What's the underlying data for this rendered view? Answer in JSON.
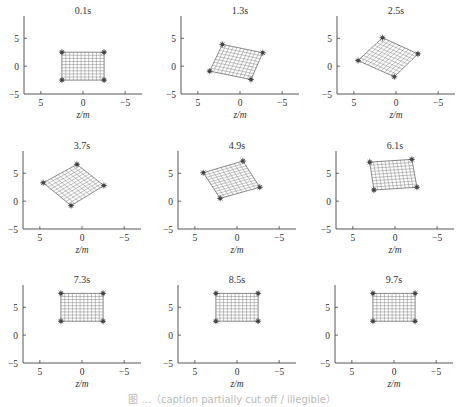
{
  "figure": {
    "caption": "图 ...（caption partially cut off / illegible）"
  },
  "chart_data": [
    {
      "type": "scatter",
      "title": "0.1s",
      "xlabel": "z/m",
      "ylabel": "",
      "xlim": [
        7,
        -7
      ],
      "ylim": [
        -5,
        9
      ],
      "xticks": [
        "5",
        "0",
        "−5"
      ],
      "yticks": [
        "5",
        "0",
        "−5"
      ],
      "corners": {
        "tl": [
          2.5,
          2.5
        ],
        "tr": [
          -2.5,
          2.5
        ],
        "br": [
          -2.5,
          -2.5
        ],
        "bl": [
          2.5,
          -2.5
        ]
      }
    },
    {
      "type": "scatter",
      "title": "1.3s",
      "xlabel": "z/m",
      "ylabel": "",
      "xlim": [
        7,
        -7
      ],
      "ylim": [
        -5,
        9
      ],
      "xticks": [
        "5",
        "0",
        "−5"
      ],
      "yticks": [
        "5",
        "0",
        "−5"
      ],
      "corners": {
        "tl": [
          2.1,
          3.9
        ],
        "tr": [
          -2.7,
          2.4
        ],
        "br": [
          -1.3,
          -2.4
        ],
        "bl": [
          3.6,
          -0.9
        ]
      }
    },
    {
      "type": "scatter",
      "title": "2.5s",
      "xlabel": "z/m",
      "ylabel": "",
      "xlim": [
        7,
        -7
      ],
      "ylim": [
        -5,
        9
      ],
      "xticks": [
        "5",
        "0",
        "−5"
      ],
      "yticks": [
        "5",
        "0",
        "−5"
      ],
      "corners": {
        "tl": [
          1.6,
          5.1
        ],
        "tr": [
          -2.6,
          2.2
        ],
        "br": [
          0.2,
          -1.9
        ],
        "bl": [
          4.5,
          1.0
        ]
      }
    },
    {
      "type": "scatter",
      "title": "3.7s",
      "xlabel": "z/m",
      "ylabel": "",
      "xlim": [
        7,
        -7
      ],
      "ylim": [
        -5,
        9
      ],
      "xticks": [
        "5",
        "0",
        "−5"
      ],
      "yticks": [
        "5",
        "0",
        "−5"
      ],
      "corners": {
        "tl": [
          0.6,
          6.6
        ],
        "tr": [
          -2.6,
          2.8
        ],
        "br": [
          1.3,
          -0.8
        ],
        "bl": [
          4.6,
          3.3
        ]
      }
    },
    {
      "type": "scatter",
      "title": "4.9s",
      "xlabel": "z/m",
      "ylabel": "",
      "xlim": [
        7,
        -7
      ],
      "ylim": [
        -5,
        9
      ],
      "xticks": [
        "5",
        "0",
        "−5"
      ],
      "yticks": [
        "5",
        "0",
        "−5"
      ],
      "corners": {
        "tl": [
          -0.7,
          7.2
        ],
        "tr": [
          -2.7,
          2.5
        ],
        "br": [
          2.0,
          0.5
        ],
        "bl": [
          4.0,
          5.1
        ]
      }
    },
    {
      "type": "scatter",
      "title": "6.1s",
      "xlabel": "z/m",
      "ylabel": "",
      "xlim": [
        7,
        -7
      ],
      "ylim": [
        -5,
        9
      ],
      "xticks": [
        "5",
        "0",
        "−5"
      ],
      "yticks": [
        "5",
        "0",
        "−5"
      ],
      "corners": {
        "tl": [
          3.0,
          7.0
        ],
        "tr": [
          -2.0,
          7.5
        ],
        "br": [
          -2.6,
          2.5
        ],
        "bl": [
          2.5,
          2.0
        ]
      }
    },
    {
      "type": "scatter",
      "title": "7.3s",
      "xlabel": "z/m",
      "ylabel": "",
      "xlim": [
        7,
        -7
      ],
      "ylim": [
        -5,
        9
      ],
      "xticks": [
        "5",
        "0",
        "−5"
      ],
      "yticks": [
        "5",
        "0",
        "−5"
      ],
      "corners": {
        "tl": [
          2.5,
          7.5
        ],
        "tr": [
          -2.5,
          7.5
        ],
        "br": [
          -2.5,
          2.5
        ],
        "bl": [
          2.5,
          2.5
        ]
      }
    },
    {
      "type": "scatter",
      "title": "8.5s",
      "xlabel": "z/m",
      "ylabel": "",
      "xlim": [
        7,
        -7
      ],
      "ylim": [
        -5,
        9
      ],
      "xticks": [
        "5",
        "0",
        "−5"
      ],
      "yticks": [
        "5",
        "0",
        "−5"
      ],
      "corners": {
        "tl": [
          2.5,
          7.5
        ],
        "tr": [
          -2.5,
          7.5
        ],
        "br": [
          -2.5,
          2.5
        ],
        "bl": [
          2.5,
          2.5
        ]
      }
    },
    {
      "type": "scatter",
      "title": "9.7s",
      "xlabel": "z/m",
      "ylabel": "",
      "xlim": [
        7,
        -7
      ],
      "ylim": [
        -5,
        9
      ],
      "xticks": [
        "5",
        "0",
        "−5"
      ],
      "yticks": [
        "5",
        "0",
        "−5"
      ],
      "corners": {
        "tl": [
          2.5,
          7.5
        ],
        "tr": [
          -2.5,
          7.5
        ],
        "br": [
          -2.5,
          2.5
        ],
        "bl": [
          2.5,
          2.5
        ]
      }
    }
  ]
}
